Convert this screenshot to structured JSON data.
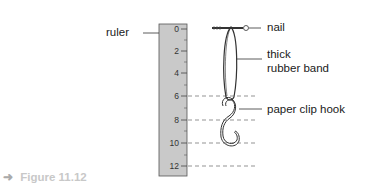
{
  "figure": {
    "caption_arrow": "➜",
    "caption": "Figure 11.12"
  },
  "labels": {
    "ruler": "ruler",
    "nail": "nail",
    "rubber_band_line1": "thick",
    "rubber_band_line2": "rubber band",
    "paper_clip_hook": "paper clip hook"
  },
  "ruler": {
    "tick_labels": [
      "0",
      "2",
      "4",
      "6",
      "8",
      "10",
      "12"
    ],
    "fill_color": "#c9c9c9"
  }
}
